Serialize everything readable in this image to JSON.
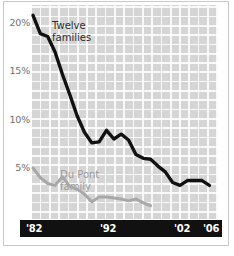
{
  "chart_data": {
    "type": "line",
    "title": "",
    "subtitle": "",
    "xlabel": "",
    "ylabel": "",
    "xlim": [
      1982,
      2006
    ],
    "ylim": [
      0,
      21.5
    ],
    "grid": true,
    "legend_position": "inline-annotation",
    "y_tick_labels": [
      "20%",
      "15%",
      "10%",
      "5%"
    ],
    "y_tick_values": [
      20,
      15,
      10,
      5
    ],
    "x_tick_labels": [
      "'82",
      "'92",
      "'02",
      "'06"
    ],
    "x_tick_values": [
      1982,
      1992,
      2002,
      2006
    ],
    "annotations": [
      {
        "name": "twelve-families-label",
        "text_line1": "Twelve",
        "text_line2": "families",
        "color": "#2b2b2b"
      },
      {
        "name": "du-pont-family-label",
        "text_line1": "Du Pont",
        "text_line2": "family",
        "color": "#9a9a9a"
      }
    ],
    "series": [
      {
        "name": "Twelve families",
        "color": "#111111",
        "x": [
          1982,
          1983,
          1984,
          1985,
          1986,
          1987,
          1988,
          1989,
          1990,
          1991,
          1992,
          1993,
          1994,
          1995,
          1996,
          1997,
          1998,
          1999,
          2000,
          2001,
          2002,
          2003,
          2004,
          2005,
          2006
        ],
        "values": [
          20.8,
          18.9,
          18.6,
          17.0,
          14.7,
          12.6,
          10.4,
          8.7,
          7.6,
          7.7,
          8.9,
          8.0,
          8.5,
          7.9,
          6.4,
          6.0,
          5.9,
          5.2,
          4.6,
          3.5,
          3.2,
          3.7,
          3.7,
          3.7,
          3.2
        ]
      },
      {
        "name": "Du Pont family",
        "color": "#a8a8a8",
        "x": [
          1982,
          1983,
          1984,
          1985,
          1986,
          1987,
          1988,
          1989,
          1990,
          1991,
          1992,
          1993,
          1994,
          1995,
          1996,
          1997,
          1998
        ],
        "values": [
          5.0,
          4.0,
          3.4,
          3.2,
          4.1,
          3.1,
          2.8,
          2.3,
          1.5,
          2.0,
          2.0,
          1.9,
          1.8,
          1.6,
          1.8,
          1.4,
          1.1
        ]
      }
    ]
  },
  "axis": {
    "y_ticks": [
      {
        "label": "20%",
        "value": 20
      },
      {
        "label": "15%",
        "value": 15
      },
      {
        "label": "10%",
        "value": 10
      },
      {
        "label": "5%",
        "value": 5
      }
    ],
    "x_ticks": [
      {
        "label": "'82",
        "value": 1982
      },
      {
        "label": "'92",
        "value": 1992
      },
      {
        "label": "'02",
        "value": 2002
      },
      {
        "label": "'06",
        "value": 2006
      }
    ]
  },
  "labels": {
    "twelve_families": {
      "line1": "Twelve",
      "line2": "families"
    },
    "du_pont_family": {
      "line1": "Du Pont",
      "line2": "family"
    }
  },
  "colors": {
    "twelve_families_line": "#111111",
    "du_pont_line": "#a8a8a8",
    "plot_background": "#d5d5d5",
    "grid_line": "#ffffff",
    "axis_band": "#111111",
    "axis_band_text": "#ffffff",
    "tick_text": "#6e6e6e"
  }
}
